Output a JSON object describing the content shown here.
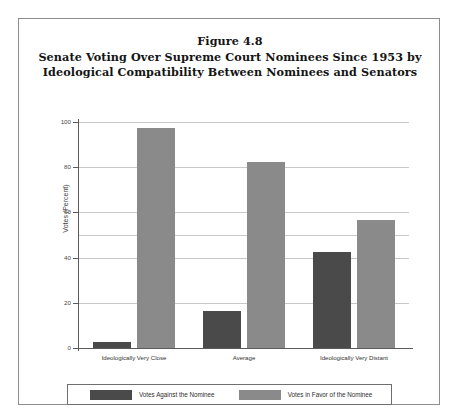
{
  "figure": {
    "number_line": "Figure 4.8",
    "title_line_1": "Senate Voting Over Supreme Court Nominees Since 1953 by",
    "title_line_2": "Ideological Compatibility Between Nominees and Senators"
  },
  "colors": {
    "against": "#4a4a4a",
    "favor": "#8a8a8a",
    "gridline": "#c8c8c8",
    "axis": "#5b5b5b",
    "frame": "#8d8d8d"
  },
  "chart_data": {
    "type": "bar",
    "title": "Senate Voting Over Supreme Court Nominees Since 1953 by Ideological Compatibility Between Nominees and Senators",
    "xlabel": "",
    "ylabel": "Votes (Percent)",
    "ylim": [
      0,
      100
    ],
    "yticks": [
      0,
      20,
      40,
      60,
      80,
      100
    ],
    "ytick_labels": [
      "0",
      "20",
      "40",
      "60",
      "80",
      "100"
    ],
    "grid": true,
    "legend_position": "bottom",
    "categories": [
      "Ideologically Very Close",
      "Average",
      "Ideologically Very Distant"
    ],
    "series": [
      {
        "name": "Votes Against the Nominee",
        "color": "#4a4a4a",
        "values": [
          2.5,
          16.5,
          42.5
        ]
      },
      {
        "name": "Votes in Favor of the Nominee",
        "color": "#8a8a8a",
        "values": [
          97.5,
          82.5,
          56.5
        ]
      }
    ]
  },
  "legend": {
    "entries": [
      {
        "label": "Votes Against the Nominee"
      },
      {
        "label": "Votes in Favor of the Nominee"
      }
    ]
  }
}
